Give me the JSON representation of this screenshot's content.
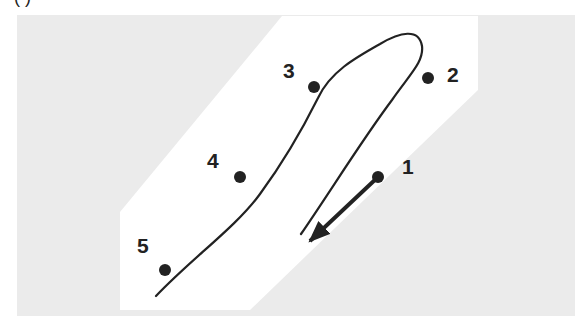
{
  "figure": {
    "caption_cropped": "( )",
    "colors": {
      "background": "#ffffff",
      "field": "#ebebeb",
      "band": "#ffffff",
      "ink": "#222222"
    },
    "field_rect": {
      "x": 17,
      "y": 15,
      "w": 558,
      "h": 301
    },
    "band_polygon": "282,16 478,16 478,90 250,310 120,310 120,212",
    "path": {
      "d": "M301,234 C330,192 362,140 392,100 C410,74 424,62 422,46 C419,28 400,32 380,44 C355,58 330,72 318,98 C305,124 285,160 260,194 C235,228 192,258 156,296"
    },
    "arrow": {
      "from": [
        378,
        177
      ],
      "to": [
        310,
        241
      ]
    },
    "points": [
      {
        "id": "1",
        "label": "1",
        "x": 378,
        "y": 177,
        "lx": 402,
        "ly": 174
      },
      {
        "id": "2",
        "label": "2",
        "x": 428,
        "y": 78,
        "lx": 447,
        "ly": 82
      },
      {
        "id": "3",
        "label": "3",
        "x": 314,
        "y": 87,
        "lx": 283,
        "ly": 78
      },
      {
        "id": "4",
        "label": "4",
        "x": 240,
        "y": 177,
        "lx": 207,
        "ly": 168
      },
      {
        "id": "5",
        "label": "5",
        "x": 165,
        "y": 270,
        "lx": 137,
        "ly": 253
      }
    ]
  }
}
